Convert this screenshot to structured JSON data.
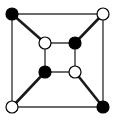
{
  "diagram": {
    "type": "graph",
    "colors": {
      "background": "#ffffff",
      "edge": "#1a1a1a",
      "edge_light": "#3a3a3a",
      "black_node": "#000000",
      "white_node": "#ffffff",
      "node_stroke": "#000000"
    },
    "nodes": [
      {
        "id": "outer-tl",
        "x": 12,
        "y": 14,
        "fill": "black"
      },
      {
        "id": "outer-tr",
        "x": 103,
        "y": 14,
        "fill": "white"
      },
      {
        "id": "outer-bl",
        "x": 12,
        "y": 107,
        "fill": "white"
      },
      {
        "id": "outer-br",
        "x": 103,
        "y": 107,
        "fill": "black"
      },
      {
        "id": "inner-tl",
        "x": 45,
        "y": 43,
        "fill": "white"
      },
      {
        "id": "inner-tr",
        "x": 75,
        "y": 43,
        "fill": "black"
      },
      {
        "id": "inner-bl",
        "x": 45,
        "y": 72,
        "fill": "black"
      },
      {
        "id": "inner-br",
        "x": 75,
        "y": 72,
        "fill": "white"
      }
    ],
    "edges": [
      {
        "from": "outer-tl",
        "to": "outer-tr",
        "style": "thin"
      },
      {
        "from": "outer-tr",
        "to": "outer-br",
        "style": "thin"
      },
      {
        "from": "outer-br",
        "to": "outer-bl",
        "style": "thin"
      },
      {
        "from": "outer-bl",
        "to": "outer-tl",
        "style": "thin"
      },
      {
        "from": "inner-tl",
        "to": "inner-tr",
        "style": "thin"
      },
      {
        "from": "inner-tr",
        "to": "inner-br",
        "style": "thin"
      },
      {
        "from": "inner-br",
        "to": "inner-bl",
        "style": "thin"
      },
      {
        "from": "inner-bl",
        "to": "inner-tl",
        "style": "thin"
      },
      {
        "from": "outer-tl",
        "to": "inner-tl",
        "style": "thick"
      },
      {
        "from": "outer-tr",
        "to": "inner-tr",
        "style": "thick"
      },
      {
        "from": "outer-bl",
        "to": "inner-bl",
        "style": "thick"
      },
      {
        "from": "outer-br",
        "to": "inner-br",
        "style": "thick"
      }
    ],
    "node_radius": 6
  }
}
